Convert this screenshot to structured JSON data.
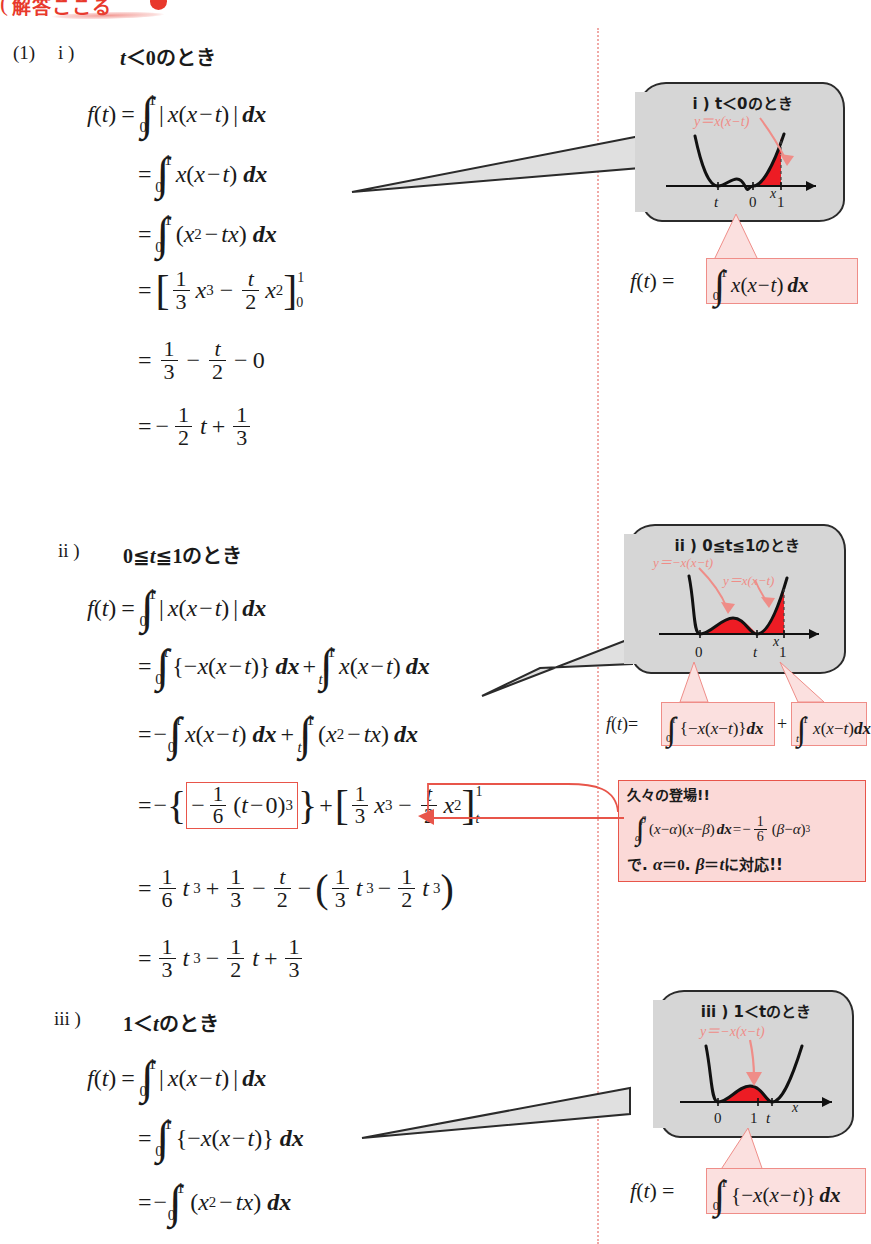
{
  "header": {
    "banner_text": "解答ここる",
    "open_paren": "("
  },
  "problem": {
    "number": "(1)"
  },
  "sections": [
    {
      "label": "i )",
      "condition": "t＜0のとき",
      "equations": [
        "f(t) = ∫₀¹ | x(x−t) | dx",
        "= ∫₀¹ x(x−t) dx",
        "= ∫₀¹ (x² − tx) dx",
        "= [ (1/3)x³ − (t/2)x² ]₀¹",
        "= 1/3 − t/2 − 0",
        "= − (1/2)t + 1/3"
      ]
    },
    {
      "label": "ii )",
      "condition": "0≦t≦1のとき",
      "equations": [
        "f(t) = ∫₀¹ | x(x−t) | dx",
        "= ∫₀ᵗ {−x(x−t)} dx + ∫ₜ¹ x(x−t) dx",
        "= −∫₀ᵗ x(x−t) dx + ∫ₜ¹ (x² − tx) dx",
        "= −{ −(1/6)(t−0)³ } + [ (1/3)x³ − (t/2)x² ]ₜ¹",
        "= (1/6)t³ + 1/3 − t/2 − ( (1/3)t³ − (1/2)t³ )",
        "= (1/3)t³ − (1/2)t + 1/3"
      ]
    },
    {
      "label": "iii )",
      "condition": "1＜tのとき",
      "equations": [
        "f(t) = ∫₀¹ | x(x−t) | dx",
        "= ∫₀¹ {−x(x−t)} dx",
        "= −∫₀¹ (x² − tx) dx"
      ]
    }
  ],
  "tokens": {
    "f_of_t": "f(t)",
    "eq": "=",
    "dx": "dx",
    "x": "x",
    "t": "t",
    "zero": "0",
    "one": "1",
    "two": "2",
    "three": "3",
    "six": "6",
    "minus": "−",
    "plus": "+",
    "abs_bar": "|",
    "lparen": "(",
    "rparen": ")",
    "lbrace": "{",
    "rbrace": "}",
    "x_minus_t": "x(x−t)",
    "x2_minus_tx": "(x²−tx)",
    "t_minus_0": "(t−0)",
    "axis_x": "x",
    "cube": "3",
    "square": "2"
  },
  "clouds": [
    {
      "title": "i )  t＜0のとき",
      "curve_label": "y＝x(x−t)",
      "axis_label": "x",
      "ticks": [
        "t",
        "0",
        "1"
      ],
      "formula": "f(t) = ∫₀¹ x(x−t) dx"
    },
    {
      "title": "ii )  0≦t≦1のとき",
      "curve_label_1": "y＝−x(x−t)",
      "curve_label_2": "y＝x(x−t)",
      "axis_label": "x",
      "ticks": [
        "0",
        "t",
        "1"
      ],
      "formula": "f(t)=∫₀ᵗ{−x(x−t)}dx+∫ₜ¹x(x−t)dx"
    },
    {
      "title": "iii )  1＜tのとき",
      "curve_label": "y＝−x(x−t)",
      "axis_label": "x",
      "ticks": [
        "0",
        "1",
        "t"
      ],
      "formula": "f(t) = ∫₀¹ {−x(x−t)} dx"
    }
  ],
  "note": {
    "line1": "久々の登場!!",
    "formula": "∫ₐᵝ (x−α)(x−β) dx = −(1/6)(β−α)³",
    "line3": "で. α＝0. β＝tに対応!!",
    "alpha": "α",
    "beta": "β"
  },
  "colors": {
    "accent_red": "#e8392c",
    "fill_red": "#ed1c24",
    "pink_light": "#fbe0df",
    "pink_border": "#ef8d88",
    "note_bg": "#fbd9d7",
    "note_border": "#e8554a",
    "cloud_fill": "#d6d6d6",
    "cloud_stroke": "#2b2b2b",
    "divider": "#f0a9a6",
    "curve_label": "#e8554a"
  }
}
